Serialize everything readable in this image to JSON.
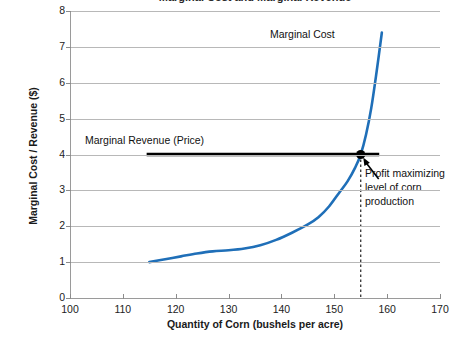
{
  "chart_data": {
    "type": "line",
    "title": "Marginal Cost and Marginal Revenue",
    "xlabel": "Quantity of Corn (bushels per acre)",
    "ylabel": "Marginal Cost / Revenue ($)",
    "xlim": [
      100,
      170
    ],
    "ylim": [
      0,
      8
    ],
    "xticks": [
      100,
      110,
      120,
      130,
      140,
      150,
      160,
      170
    ],
    "yticks": [
      0,
      1,
      2,
      3,
      4,
      5,
      6,
      7,
      8
    ],
    "grid": true,
    "legend_position": "none",
    "series": [
      {
        "name": "Marginal Cost",
        "color": "#1F6FB8",
        "type": "line",
        "x": [
          115,
          118,
          121,
          124,
          127,
          130,
          133,
          136,
          139,
          142,
          145,
          147,
          149,
          151,
          152.5,
          154,
          155,
          156,
          157,
          158,
          159
        ],
        "values": [
          1.0,
          1.08,
          1.16,
          1.24,
          1.3,
          1.33,
          1.38,
          1.47,
          1.62,
          1.82,
          2.05,
          2.25,
          2.55,
          2.95,
          3.25,
          3.65,
          4.0,
          4.55,
          5.3,
          6.3,
          7.4
        ]
      },
      {
        "name": "Marginal Revenue (Price)",
        "color": "#000000",
        "type": "hline",
        "x": [
          114.5,
          158.5
        ],
        "values": [
          4.0,
          4.0
        ]
      }
    ],
    "annotations": [
      {
        "name": "marginal-cost-label",
        "text": "Marginal Cost",
        "x": 144,
        "y": 7.55
      },
      {
        "name": "marginal-revenue-label",
        "text": "Marginal  Revenue (Price)",
        "x": 107,
        "y": 4.65
      },
      {
        "name": "profit-max-label",
        "text": "Profit maximizing level of corn production",
        "x": 156,
        "y": 3.7
      }
    ],
    "markers": [
      {
        "name": "equilibrium-point",
        "x": 155,
        "y": 4.0,
        "color": "#000000"
      }
    ],
    "reference_lines": [
      {
        "name": "quantity-dropline",
        "x": 155,
        "style": "dashed",
        "from_y": 4.0,
        "to_y": 0
      }
    ]
  }
}
